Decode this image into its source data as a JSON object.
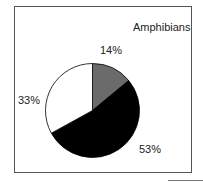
{
  "chart_data": {
    "type": "pie",
    "title": "Amphibians",
    "categories": [
      "Gray segment",
      "Black segment",
      "White segment"
    ],
    "values": [
      14,
      53,
      33
    ],
    "labels": [
      "14%",
      "53%",
      "33%"
    ],
    "colors": [
      "#6b6b6b",
      "#000000",
      "#ffffff"
    ],
    "legend": null
  }
}
